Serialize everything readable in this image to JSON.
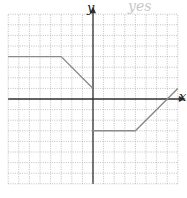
{
  "chart_data": {
    "type": "line",
    "title": "",
    "xlabel": "x",
    "ylabel": "y",
    "xlim": [
      -8,
      8
    ],
    "ylim": [
      -8,
      8
    ],
    "grid": true,
    "grid_style": "dotted",
    "series": [
      {
        "name": "piecewise-left",
        "points": [
          [
            -8,
            4
          ],
          [
            -3,
            4
          ],
          [
            0,
            1
          ]
        ]
      },
      {
        "name": "piecewise-right",
        "points": [
          [
            0,
            -3
          ],
          [
            4,
            -3
          ],
          [
            8,
            1
          ]
        ]
      }
    ],
    "annotations": [
      "yes"
    ]
  },
  "labels": {
    "x_axis": "x",
    "y_axis": "y",
    "handwritten_note": "yes"
  },
  "colors": {
    "grid": "#b0b0b0",
    "axis": "#333333",
    "line": "#8a8a8a"
  }
}
